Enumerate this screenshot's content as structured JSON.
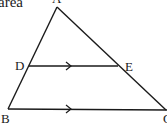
{
  "caption_fragment": "area",
  "points": {
    "A": {
      "label": "A",
      "x": 57,
      "y": 7
    },
    "B": {
      "label": "B",
      "x": 8,
      "y": 109
    },
    "C": {
      "label": "C",
      "x": 166,
      "y": 110
    },
    "D": {
      "label": "D",
      "x": 29,
      "y": 66
    },
    "E": {
      "label": "E",
      "x": 118,
      "y": 66
    }
  },
  "segments": [
    {
      "from": "A",
      "to": "B"
    },
    {
      "from": "A",
      "to": "C"
    },
    {
      "from": "B",
      "to": "C",
      "parallel_marker": true
    },
    {
      "from": "D",
      "to": "E",
      "parallel_marker": true
    }
  ],
  "relation": "DE parallel to BC",
  "stroke_color": "#1a1a1a"
}
